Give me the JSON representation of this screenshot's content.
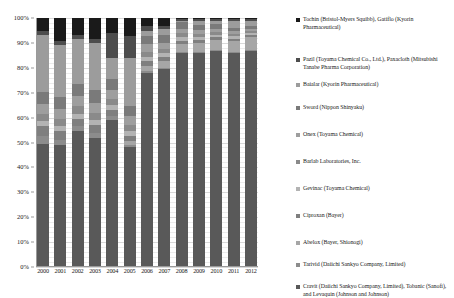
{
  "chart_data": {
    "type": "bar",
    "subtype": "100% stacked column",
    "title": "",
    "xlabel": "",
    "ylabel": "",
    "ylim": [
      0,
      100
    ],
    "ytick_labels": [
      "0%",
      "10%",
      "20%",
      "30%",
      "40%",
      "50%",
      "60%",
      "70%",
      "80%",
      "90%",
      "100%"
    ],
    "ytick_values": [
      0,
      10,
      20,
      30,
      40,
      50,
      60,
      70,
      80,
      90,
      100
    ],
    "grid": true,
    "legend_position": "right",
    "categories": [
      "2000",
      "2001",
      "2002",
      "2003",
      "2004",
      "2005",
      "2006",
      "2007",
      "2008",
      "2009",
      "2010",
      "2011",
      "2012"
    ],
    "stack_order_bottom_to_top": [
      "Cravit (Daiichi Sankyo Company, Limited), Tobanic (Sanofi), and Levaquin (Johnson and Johnson)",
      "Tarivid (Daiichi Sankyo Company, Limited)",
      "Abelox (Bayer, Shionogi)",
      "Ciproxan (Bayer)",
      "Gevinac (Toyama Chemical)",
      "Barlab Laboratories, Inc.",
      "Onex (Toyama Chemical)",
      "Sword (Nippon Shinyaku)",
      "Baialar (Kyorin Pharmaceutical)",
      "Pazil (Toyama Chemical Co., Ltd.), Paxacloth (Mitsubishi Tanabe Pharma Corporation)",
      "Tochin (Bristol-Myers Squibb), Gatiflo (Kyorin Pharmaceutical)"
    ],
    "series": [
      {
        "name": "Cravit (Daiichi Sankyo Company, Limited), Tobanic (Sanofi), and Levaquin (Johnson and Johnson)",
        "color": "#595959",
        "values": [
          49.5,
          49.0,
          54.5,
          52.0,
          59.0,
          48.0,
          78.0,
          79.5,
          86.0,
          86.0,
          86.0,
          86.0,
          86.0
        ]
      },
      {
        "name": "Tarivid (Daiichi Sankyo Company, Limited)",
        "color": "#8c8c8c",
        "values": [
          3.0,
          2.0,
          2.0,
          2.0,
          1.5,
          1.0,
          0.8,
          0.6,
          0.5,
          0.4,
          0.3,
          0.3,
          0.3
        ]
      },
      {
        "name": "Abelox (Bayer, Shionogi)",
        "color": "#a6a6a6",
        "values": [
          0.0,
          0.0,
          0.0,
          0.0,
          0.0,
          1.5,
          2.0,
          2.5,
          3.0,
          3.5,
          4.0,
          4.5,
          5.0
        ]
      },
      {
        "name": "Ciproxan (Bayer)",
        "color": "#7f7f7f",
        "values": [
          4.0,
          3.5,
          3.0,
          3.0,
          2.5,
          2.0,
          1.8,
          1.6,
          1.4,
          1.2,
          1.0,
          0.9,
          0.8
        ]
      },
      {
        "name": "Gevinac (Toyama Chemical)",
        "color": "#b3b3b3",
        "values": [
          2.0,
          2.0,
          2.0,
          2.0,
          2.0,
          2.0,
          1.8,
          1.6,
          1.4,
          1.2,
          1.0,
          0.9,
          0.8
        ]
      },
      {
        "name": "Barlab Laboratories, Inc.",
        "color": "#8a8a8a",
        "values": [
          3.0,
          3.0,
          3.0,
          3.0,
          2.5,
          2.5,
          2.0,
          1.8,
          1.5,
          1.3,
          1.0,
          0.9,
          0.8
        ]
      },
      {
        "name": "Onex (Toyama Chemical)",
        "color": "#9e9e9e",
        "values": [
          4.0,
          4.0,
          4.0,
          4.0,
          3.5,
          3.5,
          3.0,
          2.5,
          2.0,
          1.8,
          1.5,
          1.2,
          1.0
        ]
      },
      {
        "name": "Sword (Nippon Shinyaku)",
        "color": "#7a7a7a",
        "values": [
          5.0,
          5.0,
          5.0,
          5.0,
          4.5,
          4.0,
          3.5,
          3.0,
          2.5,
          2.0,
          1.8,
          1.5,
          1.2
        ]
      },
      {
        "name": "Baialar (Kyorin Pharmaceutical)",
        "color": "#9c9c9c",
        "values": [
          22.5,
          20.5,
          18.0,
          19.0,
          8.5,
          19.5,
          2.1,
          2.4,
          0.7,
          1.6,
          1.4,
          2.8,
          2.1
        ]
      },
      {
        "name": "Pazil (Toyama Chemical Co., Ltd.), Paxacloth (Mitsubishi Tanabe Pharma Corporation)",
        "color": "#4d4d4d",
        "values": [
          2.0,
          2.0,
          1.5,
          1.5,
          10.0,
          9.0,
          2.0,
          1.5,
          0.5,
          0.5,
          0.5,
          0.5,
          0.5
        ]
      },
      {
        "name": "Tochin (Bristol-Myers Squibb), Gatiflo (Kyorin Pharmaceutical)",
        "color": "#1a1a1a",
        "values": [
          5.0,
          9.0,
          7.0,
          8.5,
          6.0,
          7.0,
          3.0,
          3.0,
          0.5,
          0.5,
          0.5,
          0.5,
          0.5
        ]
      }
    ]
  },
  "legend": {
    "items": [
      {
        "label": "Tochin (Bristol-Myers Squibb), Gatiflo (Kyorin Pharmaceutical)",
        "color": "#1a1a1a"
      },
      {
        "label": "Pazil (Toyama Chemical Co., Ltd.), Paxacloth (Mitsubishi Tanabe Pharma Corporation)",
        "color": "#4d4d4d"
      },
      {
        "label": "Baialar (Kyorin Pharmaceutical)",
        "color": "#9c9c9c"
      },
      {
        "label": "Sword (Nippon Shinyaku)",
        "color": "#7a7a7a"
      },
      {
        "label": "Onex (Toyama Chemical)",
        "color": "#9e9e9e"
      },
      {
        "label": "Barlab Laboratories, Inc.",
        "color": "#8a8a8a"
      },
      {
        "label": "Gevinac (Toyama Chemical)",
        "color": "#b3b3b3"
      },
      {
        "label": "Ciproxan (Bayer)",
        "color": "#7f7f7f"
      },
      {
        "label": "Abelox (Bayer, Shionogi)",
        "color": "#a6a6a6"
      },
      {
        "label": "Tarivid (Daiichi Sankyo Company, Limited)",
        "color": "#8c8c8c"
      },
      {
        "label": "Cravit (Daiichi Sankyo Company, Limited), Tobanic (Sanofi), and Levaquin (Johnson and Johnson)",
        "color": "#595959"
      }
    ]
  }
}
